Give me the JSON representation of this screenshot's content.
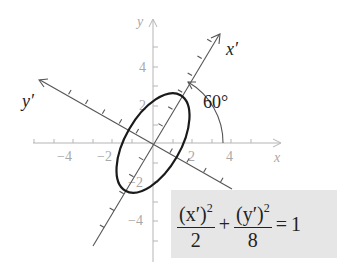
{
  "diagram": {
    "type": "rotated-ellipse",
    "axes": {
      "x_label": "x",
      "y_label": "y",
      "x_prime_label": "x′",
      "y_prime_label": "y′",
      "x_ticks": [
        "−4",
        "−2",
        "2",
        "4"
      ],
      "y_ticks": [
        "4",
        "2",
        "−2",
        "−4"
      ]
    },
    "rotation_angle_label": "60°",
    "equation": {
      "term1_numerator": "(x′)",
      "term1_exponent": "2",
      "term1_denominator": "2",
      "plus": "+",
      "term2_numerator": "(y′)",
      "term2_exponent": "2",
      "term2_denominator": "8",
      "equals": "=",
      "rhs": "1"
    },
    "colors": {
      "axes": "#b5b5b5",
      "rotated_axes": "#555555",
      "ellipse": "#1a1a1a",
      "formula_bg": "#e6e6e6"
    }
  }
}
